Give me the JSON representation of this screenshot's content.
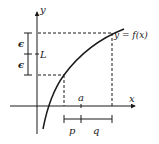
{
  "diagram": {
    "type": "epsilon-delta limit illustration",
    "labels": {
      "y_axis": "y",
      "x_axis": "x",
      "curve": "y = f(x)",
      "limit": "L",
      "epsilon_top": "ϵ",
      "epsilon_bottom": "ϵ",
      "point_a": "a",
      "interval_left": "p",
      "interval_right": "q"
    },
    "colors": {
      "ink": "#1a1a1a",
      "background": "#ffffff"
    }
  }
}
